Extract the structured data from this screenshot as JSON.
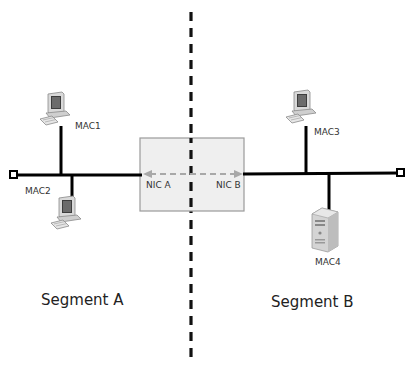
{
  "diagram": {
    "type": "network-bridge-segments",
    "segments": [
      {
        "label": "Segment A"
      },
      {
        "label": "Segment B"
      }
    ],
    "bridge": {
      "nic_left": "NIC A",
      "nic_right": "NIC B"
    },
    "nodes": [
      {
        "id": "mac1",
        "label": "MAC1",
        "kind": "workstation",
        "segment": "A"
      },
      {
        "id": "mac2",
        "label": "MAC2",
        "kind": "workstation",
        "segment": "A"
      },
      {
        "id": "mac3",
        "label": "MAC3",
        "kind": "workstation",
        "segment": "B"
      },
      {
        "id": "mac4",
        "label": "MAC4",
        "kind": "server",
        "segment": "B"
      }
    ],
    "colors": {
      "bus": "#000000",
      "divider": "#111111",
      "bridge_fill": "#efefef",
      "bridge_border": "#9a9a9a",
      "arrow": "#a8a8a8"
    }
  }
}
